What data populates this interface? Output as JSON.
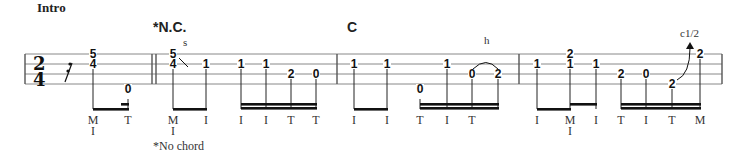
{
  "section_title": "Intro",
  "time_signature": {
    "top": "2",
    "bottom": "4"
  },
  "chords": [
    {
      "label": "*N.C.",
      "x": 153
    },
    {
      "label": "C",
      "x": 347
    }
  ],
  "footnote": "*No chord",
  "staff": {
    "lines_y": [
      54,
      64,
      74,
      84
    ],
    "x_start": 25,
    "x_end": 722
  },
  "barlines": [
    {
      "x": 25,
      "type": "single"
    },
    {
      "x": 152,
      "type": "double"
    },
    {
      "x": 337,
      "type": "single"
    },
    {
      "x": 519,
      "type": "single"
    },
    {
      "x": 722,
      "type": "single"
    }
  ],
  "rest": {
    "symbol": "sixteenth-rest",
    "x": 65
  },
  "techniques": [
    {
      "label": "s",
      "x": 183,
      "y": 46
    },
    {
      "label": "h",
      "x": 484,
      "y": 44
    },
    {
      "label": "c1/2",
      "x": 680,
      "y": 37
    }
  ],
  "measures": [
    {
      "notes": [
        {
          "x": 93,
          "frets": [
            {
              "v": "5",
              "line": 0
            },
            {
              "v": "4",
              "line": 1
            }
          ],
          "finger": [
            "M",
            "I"
          ]
        },
        {
          "x": 128,
          "frets": [
            {
              "v": "0",
              "line": 4
            }
          ],
          "finger": [
            "T"
          ]
        }
      ]
    },
    {
      "notes": [
        {
          "x": 173,
          "frets": [
            {
              "v": "5",
              "line": 0
            },
            {
              "v": "4",
              "line": 1
            }
          ],
          "finger": [
            "M",
            "I"
          ]
        },
        {
          "x": 206,
          "frets": [
            {
              "v": "1",
              "line": 1
            }
          ],
          "finger": [
            "I"
          ]
        },
        {
          "x": 241,
          "frets": [
            {
              "v": "1",
              "line": 1
            }
          ],
          "finger": [
            "I"
          ]
        },
        {
          "x": 266,
          "frets": [
            {
              "v": "1",
              "line": 1
            }
          ],
          "finger": [
            "I"
          ]
        },
        {
          "x": 291,
          "frets": [
            {
              "v": "2",
              "line": 2
            }
          ],
          "finger": [
            "T"
          ]
        },
        {
          "x": 316,
          "frets": [
            {
              "v": "0",
              "line": 2
            }
          ],
          "finger": [
            "T"
          ]
        }
      ]
    },
    {
      "notes": [
        {
          "x": 354,
          "frets": [
            {
              "v": "1",
              "line": 1
            }
          ],
          "finger": [
            "I"
          ]
        },
        {
          "x": 387,
          "frets": [
            {
              "v": "1",
              "line": 1
            }
          ],
          "finger": [
            "I"
          ]
        },
        {
          "x": 420,
          "frets": [
            {
              "v": "0",
              "line": 4
            }
          ],
          "finger": [
            "T"
          ]
        },
        {
          "x": 447,
          "frets": [
            {
              "v": "1",
              "line": 1
            }
          ],
          "finger": [
            "I"
          ]
        },
        {
          "x": 472,
          "frets": [
            {
              "v": "0",
              "line": 2
            }
          ],
          "finger": [
            "T"
          ]
        },
        {
          "x": 498,
          "frets": [
            {
              "v": "2",
              "line": 2
            }
          ],
          "finger": []
        }
      ]
    },
    {
      "notes": [
        {
          "x": 537,
          "frets": [
            {
              "v": "1",
              "line": 1
            }
          ],
          "finger": [
            "I"
          ]
        },
        {
          "x": 570,
          "frets": [
            {
              "v": "2",
              "line": 0
            },
            {
              "v": "1",
              "line": 1
            }
          ],
          "finger": [
            "M",
            "I"
          ]
        },
        {
          "x": 596,
          "frets": [
            {
              "v": "1",
              "line": 1
            }
          ],
          "finger": [
            "I"
          ]
        },
        {
          "x": 621,
          "frets": [
            {
              "v": "2",
              "line": 2
            }
          ],
          "finger": [
            "T"
          ]
        },
        {
          "x": 646,
          "frets": [
            {
              "v": "0",
              "line": 2
            }
          ],
          "finger": [
            "I"
          ]
        },
        {
          "x": 672,
          "frets": [
            {
              "v": "2",
              "line": 3
            }
          ],
          "finger": [
            "T"
          ]
        },
        {
          "x": 700,
          "frets": [
            {
              "v": "2",
              "line": 0
            }
          ],
          "finger": [
            "M"
          ]
        }
      ]
    }
  ],
  "beams": [
    {
      "x1": 93,
      "x2": 128,
      "y": 108,
      "count": 1
    },
    {
      "x1": 121,
      "x2": 128,
      "y": 103,
      "count": 1
    },
    {
      "x1": 173,
      "x2": 206,
      "y": 108,
      "count": 1
    },
    {
      "x1": 241,
      "x2": 316,
      "y": 103,
      "count": 2
    },
    {
      "x1": 354,
      "x2": 387,
      "y": 108,
      "count": 1
    },
    {
      "x1": 420,
      "x2": 498,
      "y": 103,
      "count": 2
    },
    {
      "x1": 537,
      "x2": 570,
      "y": 108,
      "count": 1
    },
    {
      "x1": 570,
      "x2": 596,
      "y": 103,
      "count": 1
    },
    {
      "x1": 621,
      "x2": 700,
      "y": 103,
      "count": 2
    }
  ]
}
